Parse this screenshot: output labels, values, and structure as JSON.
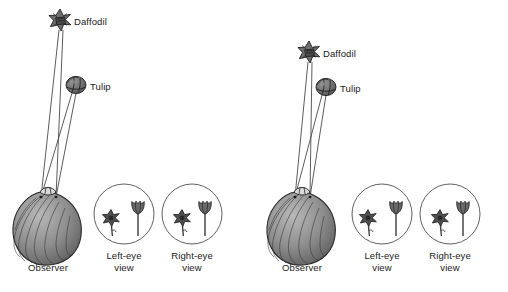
{
  "figure": {
    "type": "diagram",
    "panel_count": 2,
    "background_color": "#ffffff",
    "ink_color": "#1a1a1a",
    "head_fill_color": "#8a8a8a",
    "head_stroke_color": "#2b2b2b",
    "flower_fill_color": "#6e6e6e",
    "sightline_color": "#4a4a4a",
    "circle_stroke_color": "#4f4f4f"
  },
  "labels": {
    "daffodil": "Daffodil",
    "tulip": "Tulip",
    "observer": "Observer",
    "left_eye_view_line1": "Left-eye",
    "left_eye_view_line2": "view",
    "right_eye_view_line1": "Right-eye",
    "right_eye_view_line2": "view"
  },
  "panels": [
    {
      "id": "panel-left",
      "name": "left-panel",
      "origin_x": 0,
      "daffodil": {
        "x": 60,
        "y": 20,
        "label_x": 74,
        "label_y": 16
      },
      "tulip": {
        "x": 76,
        "y": 85,
        "label_x": 90,
        "label_y": 81
      },
      "observer": {
        "head_cx": 48,
        "head_cy": 226,
        "label_x": 48,
        "label_y": 263
      },
      "eyes": [
        {
          "x": 41,
          "y": 197
        },
        {
          "x": 56,
          "y": 197
        }
      ],
      "sightlines": [
        {
          "from_eye": 0,
          "to": "daffodil"
        },
        {
          "from_eye": 1,
          "to": "daffodil"
        },
        {
          "from_eye": 0,
          "to": "tulip"
        },
        {
          "from_eye": 1,
          "to": "tulip"
        }
      ],
      "views": [
        {
          "id": "left-eye-view",
          "cx": 124,
          "cy": 214,
          "r": 30,
          "label_x": 124,
          "label_y": 251,
          "daffodil_x": 111,
          "daffodil_y": 218,
          "tulip_x": 138,
          "tulip_y": 209,
          "separation_px": 27
        },
        {
          "id": "right-eye-view",
          "cx": 192,
          "cy": 214,
          "r": 30,
          "label_x": 192,
          "label_y": 251,
          "daffodil_x": 182,
          "daffodil_y": 218,
          "tulip_x": 205,
          "tulip_y": 209,
          "separation_px": 23
        }
      ]
    },
    {
      "id": "panel-right",
      "name": "right-panel",
      "origin_x": 254,
      "daffodil": {
        "x": 55,
        "y": 52,
        "label_x": 69,
        "label_y": 48
      },
      "tulip": {
        "x": 72,
        "y": 87,
        "label_x": 86,
        "label_y": 83
      },
      "observer": {
        "head_cx": 48,
        "head_cy": 226,
        "label_x": 48,
        "label_y": 263
      },
      "eyes": [
        {
          "x": 41,
          "y": 197
        },
        {
          "x": 56,
          "y": 197
        }
      ],
      "sightlines": [
        {
          "from_eye": 0,
          "to": "daffodil"
        },
        {
          "from_eye": 1,
          "to": "daffodil"
        },
        {
          "from_eye": 0,
          "to": "tulip"
        },
        {
          "from_eye": 1,
          "to": "tulip"
        }
      ],
      "views": [
        {
          "id": "left-eye-view",
          "cx": 128,
          "cy": 214,
          "r": 30,
          "label_x": 128,
          "label_y": 251,
          "daffodil_x": 114,
          "daffodil_y": 218,
          "tulip_x": 142,
          "tulip_y": 209,
          "separation_px": 28
        },
        {
          "id": "right-eye-view",
          "cx": 196,
          "cy": 214,
          "r": 30,
          "label_x": 196,
          "label_y": 251,
          "daffodil_x": 186,
          "daffodil_y": 218,
          "tulip_x": 209,
          "tulip_y": 209,
          "separation_px": 23
        }
      ]
    }
  ]
}
